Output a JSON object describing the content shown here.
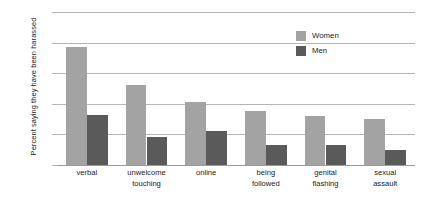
{
  "chart_data": {
    "type": "bar",
    "title": "",
    "subtitle": "",
    "xlabel": "",
    "ylabel": "Percent saying they have been harassed",
    "ylim": [
      0,
      100
    ],
    "ytick_labels": [
      "100%",
      "80%",
      "60%",
      "40%",
      "20%",
      "0%"
    ],
    "ytick_values": [
      100,
      80,
      60,
      40,
      20,
      0
    ],
    "grid": "horizontal",
    "legend_position": "upper-right-inside",
    "categories": [
      "verbal",
      "unwelcome touching",
      "online",
      "being followed",
      "genital flashing",
      "sexual assault"
    ],
    "category_label_lines": [
      [
        "verbal"
      ],
      [
        "unwelcome",
        "touching"
      ],
      [
        "online"
      ],
      [
        "being",
        "followed"
      ],
      [
        "genital",
        "flashing"
      ],
      [
        "sexual",
        "assault"
      ]
    ],
    "series": [
      {
        "name": "Women",
        "color": "#a3a3a3",
        "values": [
          77,
          52,
          41,
          35,
          32,
          30
        ]
      },
      {
        "name": "Men",
        "color": "#5a5a5a",
        "values": [
          33,
          18,
          22,
          13,
          13,
          10
        ]
      }
    ]
  },
  "legend": {
    "items": [
      {
        "label": "Women",
        "color": "#a3a3a3"
      },
      {
        "label": "Men",
        "color": "#5a5a5a"
      }
    ]
  }
}
